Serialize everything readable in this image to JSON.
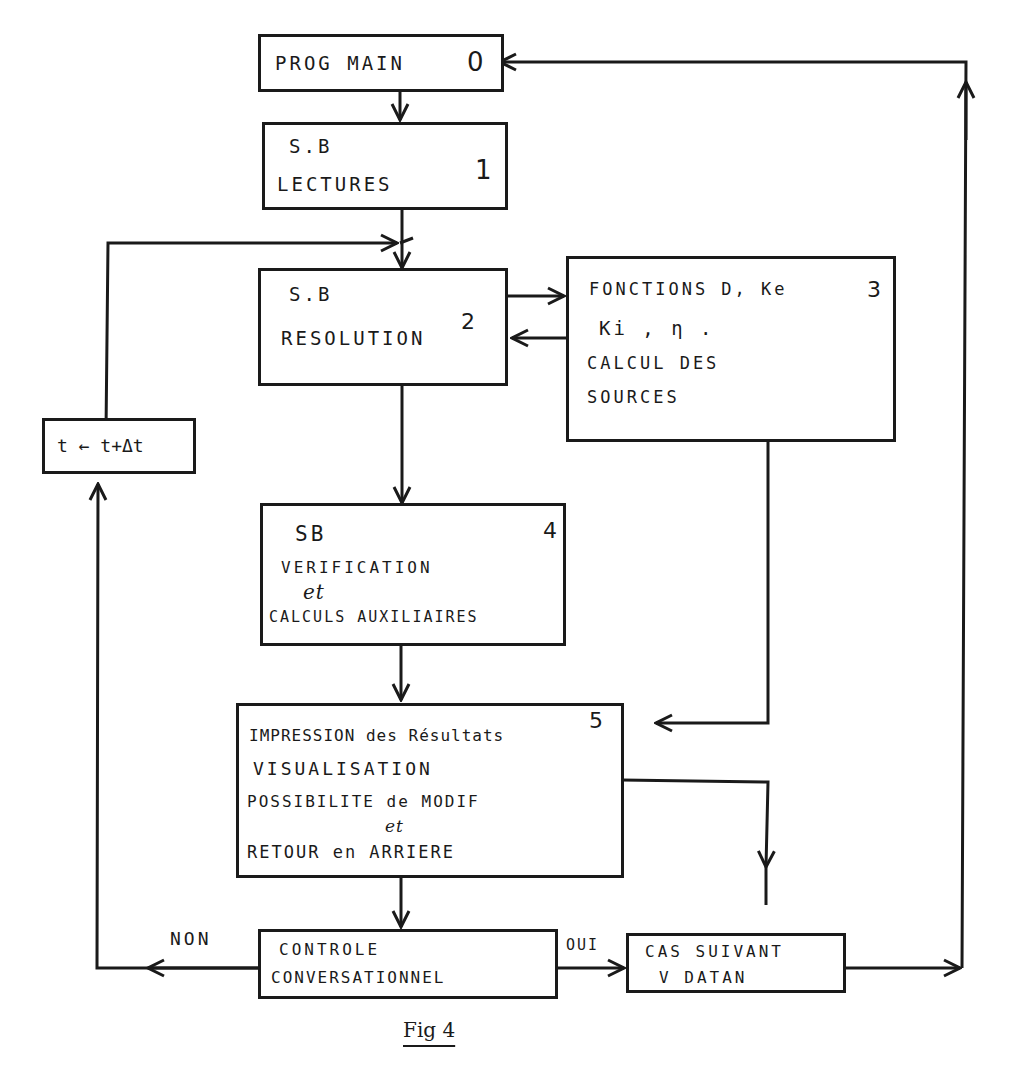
{
  "figure": {
    "caption": "Fig 4",
    "stroke_color": "#1a1a1a",
    "background": "#ffffff"
  },
  "boxes": {
    "b0": {
      "number": "0",
      "lines": [
        "PROG MAIN"
      ]
    },
    "b1": {
      "number": "1",
      "lines": [
        "S.B",
        "LECTURES"
      ]
    },
    "b2": {
      "number": "2",
      "lines": [
        "S.B",
        "RESOLUTION"
      ]
    },
    "b3": {
      "number": "3",
      "lines": [
        "FONCTIONS D, Ke",
        "Ki , η .",
        "CALCUL DES",
        "SOURCES"
      ]
    },
    "b4": {
      "number": "4",
      "lines": [
        "SB",
        "VERIFICATION",
        "et",
        "CALCULS AUXILIAIRES"
      ]
    },
    "b5": {
      "number": "5",
      "lines": [
        "IMPRESSION des Résultats",
        "VISUALISATION",
        "POSSIBILITE de MODIF",
        "et",
        "RETOUR en ARRIERE"
      ]
    },
    "b6": {
      "lines": [
        "CONTROLE",
        "CONVERSATIONNEL"
      ]
    },
    "b7": {
      "lines": [
        "CAS SUIVANT",
        "V DATAN"
      ]
    },
    "time_step": {
      "lines": [
        "t ← t+Δt"
      ]
    }
  },
  "edge_labels": {
    "no": "NON",
    "yes": "OUI"
  },
  "edges": [
    {
      "from": "b0",
      "to": "b1"
    },
    {
      "from": "b1",
      "to": "b2"
    },
    {
      "from": "b2",
      "to": "b3"
    },
    {
      "from": "b3",
      "to": "b2"
    },
    {
      "from": "b2",
      "to": "b4"
    },
    {
      "from": "b3",
      "to": "b5"
    },
    {
      "from": "b4",
      "to": "b5"
    },
    {
      "from": "b5",
      "to": "b6"
    },
    {
      "from": "b5",
      "to": "b7"
    },
    {
      "from": "b6",
      "to": "time_step",
      "label": "NON"
    },
    {
      "from": "time_step",
      "to": "b2"
    },
    {
      "from": "b6",
      "to": "b7",
      "label": "OUI"
    },
    {
      "from": "b7",
      "to": "b0"
    }
  ]
}
